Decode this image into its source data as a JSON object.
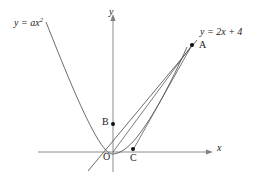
{
  "figure": {
    "background_color": "#ffffff",
    "stroke_color": "#4a4a4a",
    "axis_color": "#777777",
    "text_color": "#1a1a1a",
    "width": 262,
    "height": 177
  },
  "axes": {
    "x_label": "x",
    "y_label": "y",
    "origin_label": "O",
    "x_axis": {
      "x1": 38,
      "y1": 152,
      "x2": 212,
      "y2": 152
    },
    "y_axis": {
      "x1": 113,
      "y1": 14,
      "x2": 113,
      "y2": 172
    }
  },
  "curves": {
    "parabola": {
      "label": "y = ax",
      "exponent": "2",
      "equation": "y = ax^2",
      "vertex": {
        "x": 113,
        "y": 152
      },
      "path": "M 46,22 C 60,58 78,106 95,136 C 103,149 108,154 113,154 C 120,154 129,148 137,137 C 152,116 170,82 186,48"
    },
    "line": {
      "label": "y = 2x + 4",
      "equation": "y = 2x + 4",
      "path": "M 88,171 L 196,41",
      "slope": 2,
      "intercept": 4
    }
  },
  "points": [
    {
      "name": "A",
      "label": "A",
      "x": 192,
      "y": 45,
      "on": "intersection of line and parabola"
    },
    {
      "name": "B",
      "label": "B",
      "x": 113,
      "y": 124,
      "on": "y-axis, y-intercept of line"
    },
    {
      "name": "C",
      "label": "C",
      "x": 133,
      "y": 149,
      "on": "near x-axis, on parabola"
    },
    {
      "name": "O",
      "label": "O",
      "x": 113,
      "y": 152,
      "on": "origin"
    }
  ],
  "segments": [
    {
      "name": "segment-A-B",
      "from": "A",
      "to": "B",
      "path": "M 192,45 L 113,124"
    },
    {
      "name": "segment-A-O",
      "from": "A",
      "to": "O",
      "path": "M 192,45 L 113,152"
    },
    {
      "name": "segment-A-C",
      "from": "A",
      "to": "C",
      "path": "M 192,45 L 133,150"
    }
  ],
  "labels": {
    "parabola_prefix": "y = a",
    "parabola_var": "x",
    "parabola_exp": "2",
    "line_text": "y = 2x + 4",
    "point_a": "A",
    "point_b": "B",
    "point_c": "C",
    "point_o": "O",
    "axis_x": "x",
    "axis_y": "y"
  }
}
